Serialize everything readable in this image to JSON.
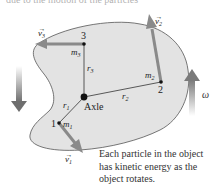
{
  "header": {
    "partial_text": "due to the motion of the particles"
  },
  "diagram": {
    "body_fill": "#e3e3e3",
    "body_stroke": "#555555",
    "arrow_color": "#8a8a8a",
    "axle": {
      "label": "Axle",
      "x": 84,
      "y": 97
    },
    "particles": [
      {
        "id": "1",
        "mass_label": "m",
        "mass_sub": "1",
        "radius_label": "r",
        "radius_sub": "1",
        "velocity_label": "v",
        "velocity_sub": "1"
      },
      {
        "id": "2",
        "mass_label": "m",
        "mass_sub": "2",
        "radius_label": "r",
        "radius_sub": "2",
        "velocity_label": "v",
        "velocity_sub": "2"
      },
      {
        "id": "3",
        "mass_label": "m",
        "mass_sub": "3",
        "radius_label": "r",
        "radius_sub": "3",
        "velocity_label": "v",
        "velocity_sub": "3"
      }
    ],
    "omega_label": "ω"
  },
  "caption": {
    "lines": [
      "Each particle in the object",
      "has kinetic energy as the",
      "object rotates."
    ]
  }
}
